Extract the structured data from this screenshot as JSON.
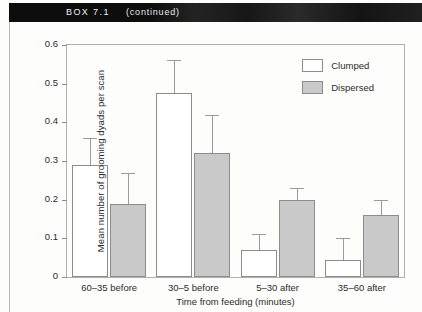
{
  "box": {
    "title": "BOX 7.1",
    "subtitle": "(continued)"
  },
  "chart_data": {
    "type": "bar",
    "title": "",
    "xlabel": "Time from feeding (minutes)",
    "ylabel": "Mean number of grooming dyads per scan",
    "ylim": [
      0,
      0.6
    ],
    "yticks": [
      "0",
      "0.1",
      "0.2",
      "0.3",
      "0.4",
      "0.5",
      "0.6"
    ],
    "ytick_values": [
      0,
      0.1,
      0.2,
      0.3,
      0.4,
      0.5,
      0.6
    ],
    "grid": false,
    "legend_position": "top-right",
    "categories": [
      "60–35 before",
      "30–5 before",
      "5–30 after",
      "35–60 after"
    ],
    "series": [
      {
        "name": "Clumped",
        "color": "#ffffff",
        "values": [
          0.29,
          0.475,
          0.07,
          0.045
        ],
        "errors_upper": [
          0.36,
          0.56,
          0.11,
          0.1
        ]
      },
      {
        "name": "Dispersed",
        "color": "#c9c9c9",
        "values": [
          0.19,
          0.32,
          0.2,
          0.16
        ],
        "errors_upper": [
          0.27,
          0.42,
          0.23,
          0.2
        ]
      }
    ]
  }
}
